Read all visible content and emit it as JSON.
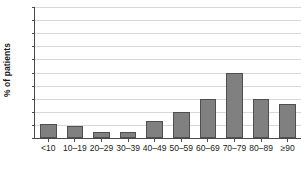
{
  "chart_data": {
    "type": "bar",
    "title": "",
    "subtitle": "",
    "xlabel": "",
    "ylabel": "% of patients",
    "categories": [
      "<10",
      "10–19",
      "20–29",
      "30–39",
      "40–49",
      "50–59",
      "60–69",
      "70–79",
      "80–89",
      "≥90"
    ],
    "values": [
      5.5,
      4.7,
      2.2,
      2.2,
      6.5,
      10,
      15,
      25,
      15,
      13
    ],
    "ylim": [
      0,
      50
    ],
    "ytick_step": 5,
    "yticks": [
      0,
      5,
      10,
      15,
      20,
      25,
      30,
      35,
      40,
      45,
      50
    ],
    "ytick_labels": [
      "0",
      "5",
      "10",
      "15",
      "20",
      "25",
      "30",
      "35",
      "40",
      "45",
      "50"
    ],
    "grid": true,
    "grid_axis": "y",
    "legend": false,
    "legend_position": "none",
    "annotations": []
  },
  "style": {
    "bar_fill": "#808080",
    "bar_border": "#4f4f4f",
    "gridline_color": "#d8d8d8",
    "axis_color": "#4a4a4a",
    "background": "#ffffff",
    "text_color": "#1a1a1a"
  }
}
